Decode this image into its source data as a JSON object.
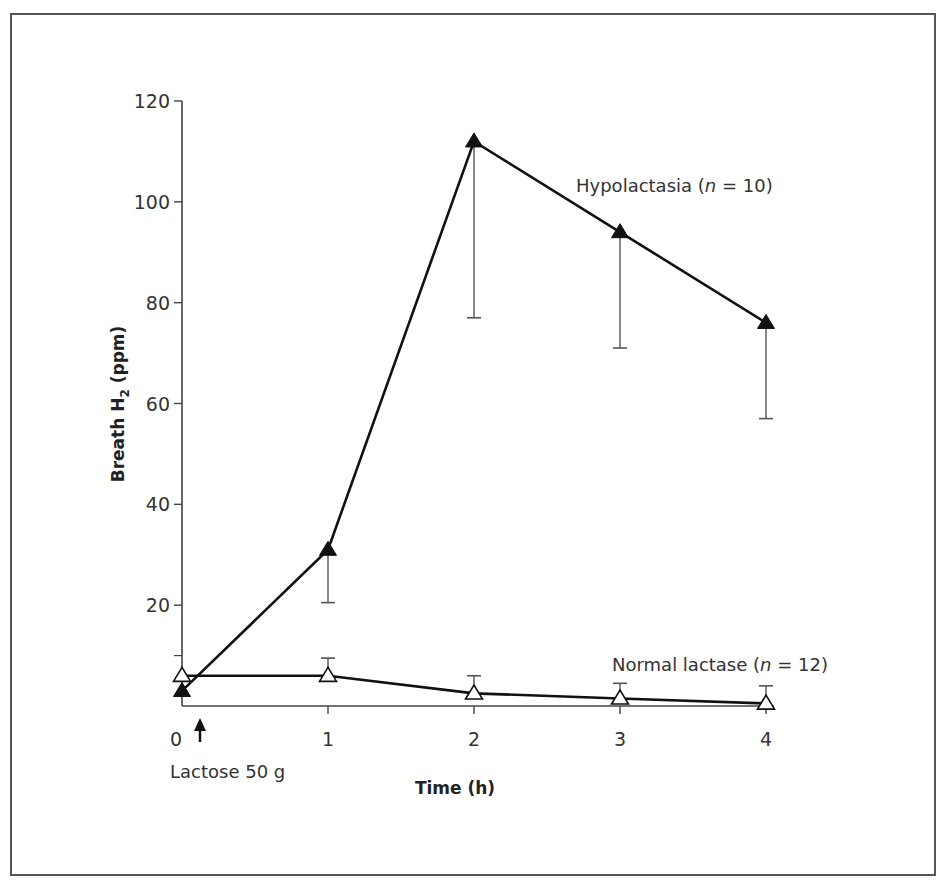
{
  "chart_data": {
    "type": "line",
    "title": "",
    "xlabel": "Time (h)",
    "ylabel": "Breath H2 (ppm)",
    "ylabel_main": "Breath H",
    "ylabel_sub": "2",
    "ylabel_unit": " (ppm)",
    "x": [
      0,
      1,
      2,
      3,
      4
    ],
    "x_tick_labels": [
      "0",
      "1",
      "2",
      "3",
      "4"
    ],
    "y_ticks": [
      20,
      40,
      60,
      80,
      100,
      120
    ],
    "y_tick_labels": [
      "20",
      "40",
      "60",
      "80",
      "100",
      "120"
    ],
    "y_minor_ticks": [
      10
    ],
    "ylim": [
      0,
      120
    ],
    "xlim": [
      0,
      4
    ],
    "grid": false,
    "legend_position": "inline annotations",
    "series": [
      {
        "name": "Hypolactasia (n = 10)",
        "label_prefix": "Hypolactasia (",
        "label_n": "n",
        "label_suffix": " = 10)",
        "marker": "filled-triangle",
        "values": [
          3,
          31,
          112,
          94,
          76
        ],
        "error_lower": [
          null,
          20.5,
          77,
          71,
          57
        ],
        "error_direction": "down"
      },
      {
        "name": "Normal lactase (n = 12)",
        "label_prefix": "Normal lactase (",
        "label_n": "n",
        "label_suffix": " = 12)",
        "marker": "open-triangle",
        "values": [
          6,
          6,
          2.5,
          1.5,
          0.5
        ],
        "error_upper": [
          null,
          9.5,
          6,
          4.5,
          4
        ],
        "error_direction": "up"
      }
    ],
    "annotations": [
      {
        "text": "Lactose 50 g",
        "x": 0.1,
        "type": "arrow-up",
        "note": "lactose dose at time 0"
      }
    ]
  },
  "colors": {
    "line": "#111111",
    "axis": "#444444",
    "frame": "#555555",
    "text": "#333333",
    "background": "#ffffff"
  }
}
